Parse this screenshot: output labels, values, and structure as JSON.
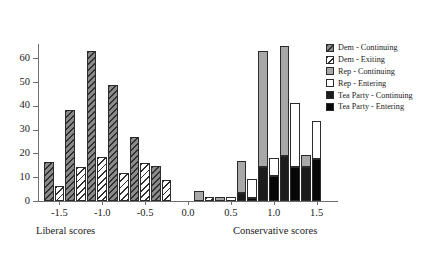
{
  "chart_data": {
    "type": "bar",
    "title": "",
    "subtitle": "",
    "xlabel": "",
    "ylabel": "",
    "grid": false,
    "legend_position": "right",
    "xlim": [
      -1.75,
      1.75
    ],
    "ylim": [
      0,
      66
    ],
    "y_ticks": [
      0,
      10,
      20,
      30,
      40,
      50,
      60
    ],
    "x_ticks": [
      -1.5,
      -1.0,
      -0.5,
      0.0,
      0.5,
      1.0,
      1.5
    ],
    "x_tick_labels": [
      "-1.5",
      "-1.0",
      "-0.5",
      "0.0",
      "0.5",
      "1.0",
      "1.5"
    ],
    "y_tick_labels": [
      "0",
      "10",
      "20",
      "30",
      "40",
      "50",
      "60"
    ],
    "annotations": [
      {
        "text": "Liberal scores",
        "x": -1.6
      },
      {
        "text": "Conservative scores",
        "x": 0.85
      }
    ],
    "series": [
      {
        "name": "Dem - Continuing",
        "key": "dem_cont",
        "fill": "dark-gray-hatched",
        "stack": "continuing",
        "x": [
          -1.625,
          -1.375,
          -1.125,
          -0.875,
          -0.625,
          -0.375,
          -0.125,
          0.125
        ],
        "values": [
          16.2,
          38.2,
          63.0,
          48.7,
          26.7,
          14.6,
          0,
          0
        ]
      },
      {
        "name": "Dem - Exiting",
        "key": "dem_exit",
        "fill": "white-hatched",
        "stack": "entering",
        "x": [
          -1.5,
          -1.25,
          -1.0,
          -0.75,
          -0.5,
          -0.25,
          0.0,
          0.25,
          0.5,
          0.75
        ],
        "values": [
          6.3,
          14.2,
          18.5,
          11.6,
          15.8,
          8.9,
          0,
          1.8,
          0,
          1.6
        ]
      },
      {
        "name": "Rep - Continuing",
        "key": "rep_cont",
        "fill": "light-gray",
        "stack": "continuing",
        "x": [
          0.125,
          0.375,
          0.625,
          0.875,
          1.125,
          1.375,
          1.625
        ],
        "values": [
          4.0,
          1.6,
          17.0,
          63.2,
          65.0,
          19.4,
          0
        ]
      },
      {
        "name": "Rep - Entering",
        "key": "rep_ent",
        "fill": "white",
        "stack": "entering",
        "x": [
          0.25,
          0.5,
          0.75,
          1.0,
          1.25,
          1.5
        ],
        "values": [
          0,
          1.7,
          9.2,
          18.1,
          41.3,
          33.5
        ]
      },
      {
        "name": "Tea Party - Continuing",
        "key": "tea_cont",
        "fill": "black",
        "stack": "continuing",
        "x": [
          0.625,
          0.875,
          1.125,
          1.375
        ],
        "values": [
          3.4,
          14.3,
          19.0,
          14.4
        ]
      },
      {
        "name": "Tea Party - Entering",
        "key": "tea_ent",
        "fill": "black",
        "stack": "entering",
        "x": [
          0.75,
          1.0,
          1.25,
          1.5
        ],
        "values": [
          1.2,
          10.4,
          14.4,
          17.6
        ]
      }
    ],
    "bars": [
      {
        "x": -1.625,
        "stack": "continuing",
        "segments": [
          {
            "series": "dem_cont",
            "value": 16.2
          }
        ]
      },
      {
        "x": -1.5,
        "stack": "entering",
        "segments": [
          {
            "series": "dem_exit",
            "value": 6.3
          }
        ]
      },
      {
        "x": -1.375,
        "stack": "continuing",
        "segments": [
          {
            "series": "dem_cont",
            "value": 38.2
          }
        ]
      },
      {
        "x": -1.25,
        "stack": "entering",
        "segments": [
          {
            "series": "dem_exit",
            "value": 14.2
          }
        ]
      },
      {
        "x": -1.125,
        "stack": "continuing",
        "segments": [
          {
            "series": "dem_cont",
            "value": 63.0
          }
        ]
      },
      {
        "x": -1.0,
        "stack": "entering",
        "segments": [
          {
            "series": "dem_exit",
            "value": 18.5
          }
        ]
      },
      {
        "x": -0.875,
        "stack": "continuing",
        "segments": [
          {
            "series": "dem_cont",
            "value": 48.7
          }
        ]
      },
      {
        "x": -0.75,
        "stack": "entering",
        "segments": [
          {
            "series": "dem_exit",
            "value": 11.6
          }
        ]
      },
      {
        "x": -0.625,
        "stack": "continuing",
        "segments": [
          {
            "series": "dem_cont",
            "value": 26.7
          }
        ]
      },
      {
        "x": -0.5,
        "stack": "entering",
        "segments": [
          {
            "series": "dem_exit",
            "value": 15.8
          }
        ]
      },
      {
        "x": -0.375,
        "stack": "continuing",
        "segments": [
          {
            "series": "dem_cont",
            "value": 14.6
          }
        ]
      },
      {
        "x": -0.25,
        "stack": "entering",
        "segments": [
          {
            "series": "dem_exit",
            "value": 8.9
          }
        ]
      },
      {
        "x": 0.125,
        "stack": "continuing",
        "segments": [
          {
            "series": "rep_cont",
            "value": 4.0
          }
        ]
      },
      {
        "x": 0.25,
        "stack": "entering",
        "segments": [
          {
            "series": "dem_exit",
            "value": 1.8
          }
        ]
      },
      {
        "x": 0.375,
        "stack": "continuing",
        "segments": [
          {
            "series": "rep_cont",
            "value": 1.6
          }
        ]
      },
      {
        "x": 0.5,
        "stack": "entering",
        "segments": [
          {
            "series": "rep_ent",
            "value": 1.7
          }
        ]
      },
      {
        "x": 0.625,
        "stack": "continuing",
        "segments": [
          {
            "series": "tea_cont",
            "value": 3.4
          },
          {
            "series": "rep_cont",
            "value": 13.6
          }
        ]
      },
      {
        "x": 0.75,
        "stack": "entering",
        "segments": [
          {
            "series": "tea_ent",
            "value": 1.2
          },
          {
            "series": "rep_ent",
            "value": 8.0
          }
        ]
      },
      {
        "x": 0.875,
        "stack": "continuing",
        "segments": [
          {
            "series": "tea_cont",
            "value": 14.3
          },
          {
            "series": "rep_cont",
            "value": 48.9
          }
        ]
      },
      {
        "x": 1.0,
        "stack": "entering",
        "segments": [
          {
            "series": "tea_ent",
            "value": 10.4
          },
          {
            "series": "rep_ent",
            "value": 7.7
          }
        ]
      },
      {
        "x": 1.125,
        "stack": "continuing",
        "segments": [
          {
            "series": "tea_cont",
            "value": 19.0
          },
          {
            "series": "rep_cont",
            "value": 46.0
          }
        ]
      },
      {
        "x": 1.25,
        "stack": "entering",
        "segments": [
          {
            "series": "tea_ent",
            "value": 14.4
          },
          {
            "series": "rep_ent",
            "value": 26.9
          }
        ]
      },
      {
        "x": 1.375,
        "stack": "continuing",
        "segments": [
          {
            "series": "tea_cont",
            "value": 14.4
          },
          {
            "series": "rep_cont",
            "value": 5.0
          }
        ]
      },
      {
        "x": 1.5,
        "stack": "entering",
        "segments": [
          {
            "series": "tea_ent",
            "value": 17.6
          },
          {
            "series": "rep_ent",
            "value": 15.9
          }
        ]
      }
    ]
  },
  "legend": {
    "items": [
      {
        "label": "Dem - Continuing",
        "key": "dem_cont"
      },
      {
        "label": "Dem - Exiting",
        "key": "dem_exit"
      },
      {
        "label": "Rep - Continuing",
        "key": "rep_cont"
      },
      {
        "label": "Rep - Entering",
        "key": "rep_ent"
      },
      {
        "label": "Tea Party - Continuing",
        "key": "tea_cont"
      },
      {
        "label": "Tea Party - Entering",
        "key": "tea_ent"
      }
    ]
  },
  "colors": {
    "axis": "#6f6f6f",
    "outline": "#2b2b2b",
    "dem_cont": "#8a8a8a",
    "dem_exit": "#ffffff",
    "rep_cont": "#a8a8a8",
    "rep_ent": "#ffffff",
    "tea_cont": "#1c1c1c",
    "tea_ent": "#070707",
    "text": "#1a1a1a"
  }
}
